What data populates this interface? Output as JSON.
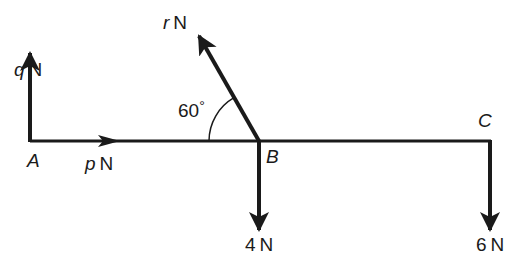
{
  "header": {
    "partial_text": "(ii) ..."
  },
  "diagram": {
    "type": "force-diagram",
    "points": [
      {
        "id": "A",
        "label": "A"
      },
      {
        "id": "B",
        "label": "B"
      },
      {
        "id": "C",
        "label": "C"
      }
    ],
    "forces": {
      "q": {
        "var": "q",
        "unit": "N",
        "direction": "up",
        "at": "A"
      },
      "p": {
        "var": "p",
        "unit": "N",
        "direction": "right",
        "at": "A"
      },
      "r": {
        "var": "r",
        "unit": "N",
        "direction": "up-left",
        "at": "B"
      },
      "four": {
        "value": "4",
        "unit": "N",
        "direction": "down",
        "at": "B"
      },
      "six": {
        "value": "6",
        "unit": "N",
        "direction": "down",
        "at": "C"
      }
    },
    "angle": {
      "value": "60",
      "symbol": "°",
      "between": "r and beam"
    },
    "line_color": "#1a1a1a"
  }
}
